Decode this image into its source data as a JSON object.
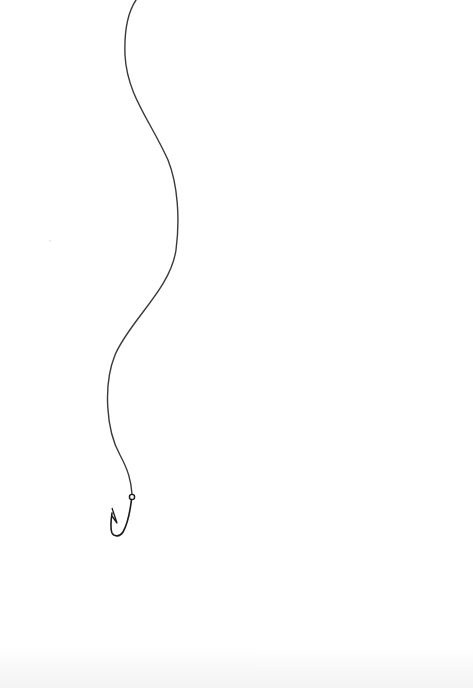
{
  "image": {
    "subject": "Fishing hook on a line",
    "description": "Pencil drawing of a wavy fishing line descending from the top edge to a small J-shaped fishing hook",
    "background_color": "#ffffff",
    "line_color": "#3a3a3a",
    "hook_color": "#1a1a1a"
  },
  "elements": {
    "line": "fishing-line",
    "hook": "fishing-hook",
    "eye": "hook-eye"
  }
}
